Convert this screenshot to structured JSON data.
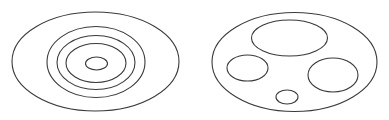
{
  "diagram": {
    "background": "#ffffff",
    "stroke_color": "#3a3a3a",
    "figures": [
      {
        "name": "concentric-ellipses",
        "ellipses": [
          {
            "cx": 95.5,
            "cy": 61.5,
            "rx": 83.5,
            "ry": 49.5
          },
          {
            "cx": 96,
            "cy": 62,
            "rx": 49,
            "ry": 35.5
          },
          {
            "cx": 96,
            "cy": 62.5,
            "rx": 39,
            "ry": 27
          },
          {
            "cx": 96,
            "cy": 63,
            "rx": 30,
            "ry": 19.5
          },
          {
            "cx": 96.5,
            "cy": 63.5,
            "rx": 11,
            "ry": 6.5
          }
        ]
      },
      {
        "name": "nested-separate-ellipses",
        "ellipses": [
          {
            "cx": 294.5,
            "cy": 62,
            "rx": 82.5,
            "ry": 49.5
          },
          {
            "cx": 289.5,
            "cy": 38,
            "rx": 38,
            "ry": 18
          },
          {
            "cx": 247.5,
            "cy": 68,
            "rx": 20.5,
            "ry": 13
          },
          {
            "cx": 333,
            "cy": 75,
            "rx": 25,
            "ry": 17
          },
          {
            "cx": 287,
            "cy": 97,
            "rx": 11,
            "ry": 7
          }
        ]
      }
    ]
  }
}
